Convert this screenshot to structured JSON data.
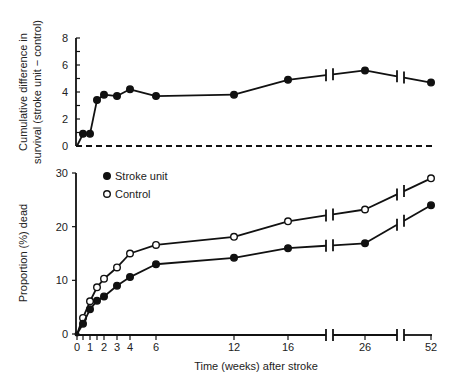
{
  "chart_data": [
    {
      "type": "line",
      "title": "",
      "ylabel": "Cumulative difference in survival (stroke unit − control)",
      "ylabel_lines": [
        "Cumulative difference in",
        "survival (stroke unit − control)"
      ],
      "xlabel": "",
      "ylim": [
        0,
        8
      ],
      "yticks": [
        0,
        2,
        4,
        6,
        8
      ],
      "x": [
        0,
        0.5,
        1,
        1.5,
        2,
        3,
        4,
        6,
        12,
        16,
        26,
        52
      ],
      "series": [
        {
          "name": "Difference",
          "marker": "filled-circle",
          "values": [
            0,
            0.9,
            0.9,
            3.4,
            3.8,
            3.7,
            4.2,
            3.7,
            3.8,
            4.9,
            5.6,
            4.7
          ]
        }
      ],
      "reference_line": {
        "y": 0,
        "style": "dashed"
      },
      "axis_breaks": [
        "between 16 and 26",
        "between 26 and 52"
      ],
      "grid": false
    },
    {
      "type": "line",
      "title": "",
      "ylabel": "Proportion (%) dead",
      "xlabel": "Time (weeks) after stroke",
      "ylim": [
        0,
        30
      ],
      "yticks": [
        0,
        10,
        20,
        30
      ],
      "xtick_labels": [
        "0",
        "1",
        "2",
        "3",
        "4",
        "6",
        "12",
        "16",
        "26",
        "52"
      ],
      "x": [
        0,
        0.5,
        1,
        1.5,
        2,
        3,
        4,
        6,
        12,
        16,
        26,
        52
      ],
      "series": [
        {
          "name": "Stroke unit",
          "marker": "filled-circle",
          "values": [
            0,
            1.9,
            4.6,
            6.2,
            7.0,
            9.0,
            10.6,
            13.0,
            14.2,
            16.0,
            16.9,
            24.0
          ]
        },
        {
          "name": "Control",
          "marker": "open-circle",
          "values": [
            0,
            3.0,
            6.1,
            8.7,
            10.3,
            12.4,
            15.0,
            16.6,
            18.1,
            21.0,
            23.2,
            29.0
          ]
        }
      ],
      "legend": {
        "position": "top-left",
        "entries": [
          "Stroke unit",
          "Control"
        ]
      },
      "axis_breaks": [
        "between 16 and 26",
        "between 26 and 52"
      ],
      "grid": false
    }
  ]
}
